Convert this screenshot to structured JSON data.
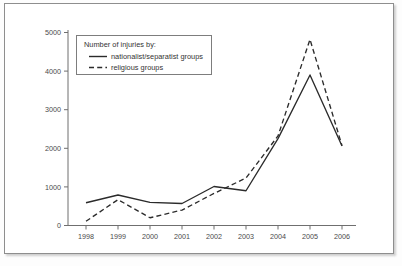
{
  "chart_data": {
    "type": "line",
    "title": "",
    "xlabel": "",
    "ylabel": "",
    "categories": [
      "1998",
      "1999",
      "2000",
      "2001",
      "2002",
      "2003",
      "2004",
      "2005",
      "2006"
    ],
    "x": [
      1998,
      1999,
      2000,
      2001,
      2002,
      2003,
      2004,
      2005,
      2006
    ],
    "series": [
      {
        "name": "nationalist/separatist groups",
        "style": "solid",
        "values": [
          590,
          790,
          600,
          570,
          1010,
          900,
          2250,
          3900,
          2060
        ]
      },
      {
        "name": "religious groups",
        "style": "dashed",
        "values": [
          110,
          670,
          200,
          400,
          830,
          1230,
          2320,
          4820,
          2070
        ]
      }
    ],
    "ylim": [
      0,
      5000
    ],
    "ytick_labels": [
      "0",
      "1000",
      "2000",
      "3000",
      "4000",
      "5000"
    ],
    "ytick_values": [
      0,
      1000,
      2000,
      3000,
      4000,
      5000
    ],
    "grid": false,
    "legend_position": "top-left",
    "legend": {
      "title": "Number of injuries by:",
      "entries": [
        {
          "label": "nationalist/separatist groups",
          "style": "solid"
        },
        {
          "label": "religious groups",
          "style": "dashed"
        }
      ]
    },
    "colors": {
      "line": "#2b2b2b",
      "axis": "#6f6f6f",
      "text": "#4a4a4a",
      "background": "#ffffff",
      "frame": "#8e8e8e"
    }
  }
}
